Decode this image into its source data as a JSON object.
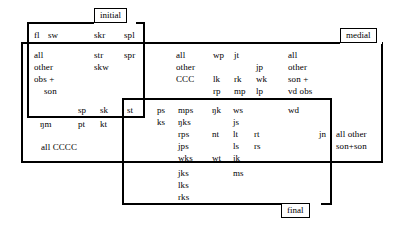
{
  "figure": {
    "type": "venn-style-overlapping-rectangles",
    "labels": {
      "initial": "initial",
      "medial": "medial",
      "final": "final"
    }
  },
  "regions": {
    "initial_only_top": {
      "name": "initial-only-top-row",
      "items": [
        "fl",
        "sw",
        "skr",
        "spl"
      ]
    },
    "initial_medial_left": {
      "name": "initial-and-medial-left",
      "summary_lines": [
        "all",
        "other",
        "obs +",
        "son"
      ],
      "items": [
        "str",
        "skw",
        "spr"
      ]
    },
    "initial_medial_bottom": {
      "name": "initial-and-medial-bottom",
      "items": [
        "sp",
        "sk"
      ]
    },
    "initial_medial_final": {
      "name": "initial-medial-final-overlap",
      "items": [
        "st"
      ]
    },
    "medial_only_left": {
      "name": "medial-only-left",
      "items": [
        "ŋm",
        "pt",
        "kt"
      ],
      "summary": "all CCCC"
    },
    "medial_only_center": {
      "name": "medial-only-center",
      "summary_lines": [
        "all",
        "other",
        "CCC"
      ],
      "col_b": [
        "wp",
        "lk",
        "rp"
      ],
      "col_c": [
        "jt",
        "rk",
        "mp"
      ],
      "col_d": [
        "jp",
        "wk",
        "lp"
      ]
    },
    "medial_only_right": {
      "name": "medial-only-right",
      "summary_lines": [
        "all",
        "other",
        "son +",
        "vd obs"
      ]
    },
    "medial_final_center": {
      "name": "medial-and-final-center",
      "col_a": [
        "ps",
        "ks"
      ],
      "col_b": [
        "mps",
        "ŋks",
        "rps",
        "jps",
        "wks"
      ],
      "col_c": [
        "ŋk",
        "nt",
        "wt"
      ],
      "col_d": [
        "ws",
        "js",
        "lt",
        "ls",
        "jk"
      ],
      "col_e": [
        "rt",
        "rs"
      ],
      "col_f": [
        "wd"
      ],
      "col_g": [
        "jn"
      ]
    },
    "final_only_center": {
      "name": "final-only-center",
      "col_b": [
        "jks",
        "lks",
        "rks"
      ],
      "col_d": [
        "ms"
      ]
    },
    "medial_only_far_right": {
      "name": "medial-only-far-right",
      "summary_lines": [
        "all other",
        "son+son"
      ]
    }
  }
}
